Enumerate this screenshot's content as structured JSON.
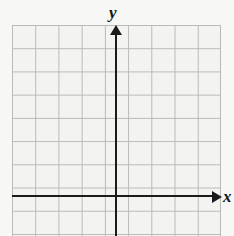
{
  "figure": {
    "kind": "blank-cartesian-coordinate-grid",
    "background_color": "#f7f7f6",
    "grid": {
      "cell_fill_color": "#f3f3f2",
      "line_color": "#b9b9b9",
      "cell_size_px": 23,
      "columns": 9,
      "rows": 10,
      "tick_labels": []
    },
    "axes": {
      "color": "#1b1b1b",
      "x_label": "x",
      "y_label": "y",
      "x_arrow": "right-arrow-icon",
      "y_arrow": "up-arrow-icon",
      "origin_px": {
        "x": 116,
        "y": 196
      }
    }
  },
  "chart_data": {
    "type": "scatter",
    "title": "",
    "subtitle": "",
    "xlabel": "x",
    "ylabel": "y",
    "series": [],
    "x": [],
    "categories": [],
    "values": [],
    "xlim": [
      -5,
      4
    ],
    "ylim": [
      -2,
      8
    ],
    "xticks": [],
    "yticks": [],
    "grid": true,
    "legend": null,
    "annotations": [],
    "note": "Empty graph paper: Cartesian axes drawn over a 9x10 square grid with no plotted data, no numeric tick labels, and no gridline numbering."
  }
}
